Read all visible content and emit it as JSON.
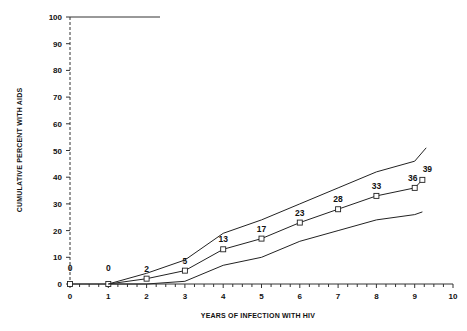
{
  "chart_data": {
    "type": "line",
    "title": "",
    "xlabel": "YEARS OF INFECTION WITH HIV",
    "ylabel": "CUMULATIVE PERCENT WITH AIDS",
    "xlim": [
      0,
      10
    ],
    "ylim": [
      0,
      100
    ],
    "x_ticks": [
      0,
      1,
      2,
      3,
      4,
      5,
      6,
      7,
      8,
      9,
      10
    ],
    "y_ticks": [
      0,
      10,
      20,
      30,
      40,
      50,
      60,
      70,
      80,
      90,
      100
    ],
    "grid": false,
    "legend": null,
    "series": [
      {
        "name": "Estimate",
        "marker": "square",
        "x": [
          0,
          1,
          2,
          3,
          4,
          5,
          6,
          7,
          8,
          9,
          9.2
        ],
        "values": [
          0,
          0,
          2,
          5,
          13,
          17,
          23,
          28,
          33,
          36,
          39
        ],
        "data_labels": [
          "0",
          "0",
          "2",
          "5",
          "13",
          "17",
          "23",
          "28",
          "33",
          "36",
          "39"
        ]
      },
      {
        "name": "Upper confidence bound",
        "marker": "none",
        "x": [
          1,
          2,
          3,
          4,
          5,
          6,
          7,
          8,
          9,
          9.3
        ],
        "values": [
          0,
          4,
          9,
          19,
          24,
          30,
          36,
          42,
          46,
          51
        ]
      },
      {
        "name": "Lower confidence bound",
        "marker": "none",
        "x": [
          1,
          2,
          3,
          4,
          5,
          6,
          7,
          8,
          9,
          9.2
        ],
        "values": [
          0,
          0,
          1,
          7,
          10,
          16,
          20,
          24,
          26,
          27
        ]
      }
    ]
  }
}
